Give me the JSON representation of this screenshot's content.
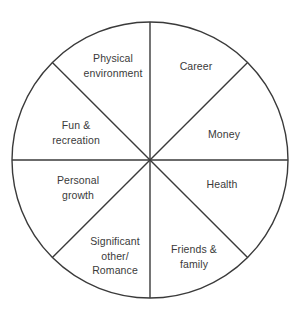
{
  "diagram": {
    "type": "wheel-of-life",
    "shape": "circle",
    "segment_count": 8,
    "geometry": {
      "center_x": 150,
      "center_y": 160,
      "radius": 138,
      "stroke_color": "#3a3a3a",
      "stroke_width": 1.4,
      "fill_color": "#ffffff"
    },
    "text_color": "#3a3a3a",
    "background_color": "#ffffff",
    "segments": [
      {
        "id": "career",
        "label": "Career",
        "angle_start_deg": -90,
        "angle_end_deg": -45,
        "label_x": 196,
        "label_y": 66
      },
      {
        "id": "money",
        "label": "Money",
        "angle_start_deg": -45,
        "angle_end_deg": 0,
        "label_x": 224,
        "label_y": 134
      },
      {
        "id": "health",
        "label": "Health",
        "angle_start_deg": 0,
        "angle_end_deg": 45,
        "label_x": 222,
        "label_y": 184
      },
      {
        "id": "friends-family",
        "label": "Friends &\nfamily",
        "angle_start_deg": 45,
        "angle_end_deg": 90,
        "label_x": 194,
        "label_y": 256
      },
      {
        "id": "significant-other-romance",
        "label": "Significant\nother/\nRomance",
        "angle_start_deg": 90,
        "angle_end_deg": 135,
        "label_x": 115,
        "label_y": 256
      },
      {
        "id": "personal-growth",
        "label": "Personal\ngrowth",
        "angle_start_deg": 135,
        "angle_end_deg": 180,
        "label_x": 78,
        "label_y": 187
      },
      {
        "id": "fun-recreation",
        "label": "Fun &\nrecreation",
        "angle_start_deg": 180,
        "angle_end_deg": 225,
        "label_x": 76,
        "label_y": 132
      },
      {
        "id": "physical-environment",
        "label": "Physical\nenvironment",
        "angle_start_deg": 225,
        "angle_end_deg": 270,
        "label_x": 113,
        "label_y": 65
      }
    ]
  }
}
